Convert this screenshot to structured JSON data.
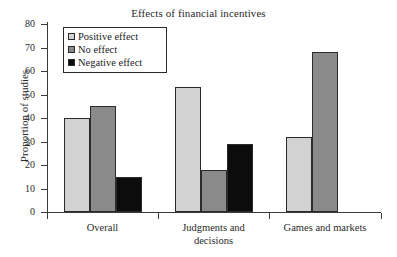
{
  "chart_data": {
    "type": "bar",
    "title": "Effects of financial incentives",
    "xlabel": "",
    "ylabel": "Proportion of studies",
    "ylim": [
      0,
      80
    ],
    "ytick_step": 10,
    "yticks": [
      "80",
      "70",
      "60",
      "50",
      "40",
      "30",
      "20",
      "10",
      "0"
    ],
    "grid": false,
    "legend_position": "upper left inside",
    "categories": [
      "Overall",
      "Judgments and decisions",
      "Games and markets"
    ],
    "category_label_lines": [
      [
        "Overall"
      ],
      [
        "Judgments and",
        "decisions"
      ],
      [
        "Games and markets"
      ]
    ],
    "series": [
      {
        "name": "Positive effect",
        "color": "#d2d2d2",
        "values": [
          40,
          53,
          32
        ]
      },
      {
        "name": "No effect",
        "color": "#8a8a8a",
        "values": [
          45,
          18,
          68
        ]
      },
      {
        "name": "Negative effect",
        "color": "#0c0c0c",
        "values": [
          15,
          29,
          null
        ]
      }
    ]
  },
  "legend": {
    "items": [
      {
        "label": "Positive effect",
        "swatch": "#d2d2d2"
      },
      {
        "label": "No effect",
        "swatch": "#8a8a8a"
      },
      {
        "label": "Negative effect",
        "swatch": "#0c0c0c"
      }
    ]
  },
  "colors": {
    "positive_effect": "#d2d2d2",
    "no_effect": "#8a8a8a",
    "negative_effect": "#0c0c0c",
    "axis": "#3a3a3a",
    "text": "#2a2a2a",
    "background": "#ffffff"
  }
}
